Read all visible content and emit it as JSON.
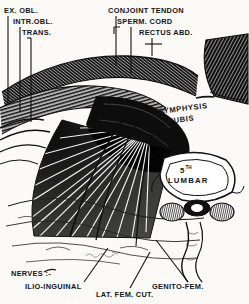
{
  "plate": {
    "title": "Inguinal region dissection",
    "style": "engraving",
    "ink_color": "#151515",
    "paper_color": "#fbfaf7"
  },
  "labels": {
    "top_left": [
      {
        "id": "ex-obl",
        "text": "EX. OBL."
      },
      {
        "id": "intr-obl",
        "text": "INTR.OBL."
      },
      {
        "id": "trans",
        "text": "TRANS."
      }
    ],
    "top_right": [
      {
        "id": "conjoint-tendon",
        "text": "CONJOINT  TENDON"
      },
      {
        "id": "sperm-cord",
        "text": "SPERM. CORD"
      },
      {
        "id": "rectus-abd",
        "text": "RECTUS ABD."
      }
    ],
    "interior": [
      {
        "id": "symphysis",
        "text": "SYMPHYSIS"
      },
      {
        "id": "pubis",
        "text": "PUBIS"
      }
    ],
    "vertebra": {
      "number": "5",
      "ordinal_suffix": "TH",
      "name": "LUMBAR"
    },
    "bottom": {
      "group_heading": "NERVES :-",
      "items": [
        {
          "id": "ilio-inguinal",
          "text": "ILIO-INGUINAL"
        },
        {
          "id": "lat-fem-cut",
          "text": "LAT. FEM. CUT."
        },
        {
          "id": "genito-fem",
          "text": "GENITO-FEM."
        }
      ]
    }
  }
}
